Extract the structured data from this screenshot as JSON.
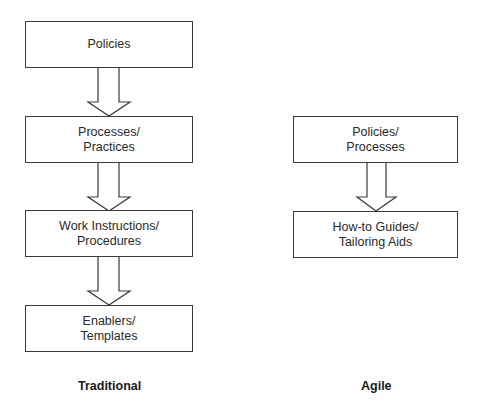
{
  "traditional": {
    "caption": "Traditional",
    "boxes": [
      {
        "line1": "Policies",
        "line2": ""
      },
      {
        "line1": "Processes/",
        "line2": "Practices"
      },
      {
        "line1": "Work Instructions/",
        "line2": "Procedures"
      },
      {
        "line1": "Enablers/",
        "line2": "Templates"
      }
    ]
  },
  "agile": {
    "caption": "Agile",
    "boxes": [
      {
        "line1": "Policies/",
        "line2": "Processes"
      },
      {
        "line1": "How-to Guides/",
        "line2": "Tailoring Aids"
      }
    ]
  },
  "colors": {
    "stroke": "#3a3a3a",
    "text": "#2a2a2a",
    "background": "#ffffff"
  }
}
